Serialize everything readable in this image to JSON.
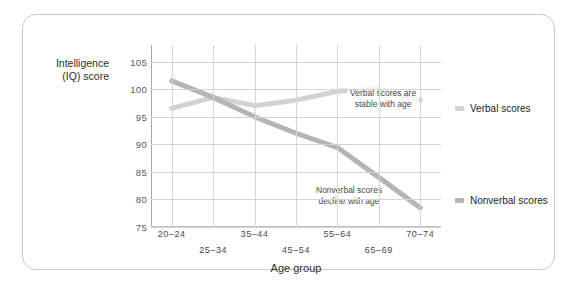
{
  "chart_data": {
    "type": "line",
    "title": "",
    "xlabel": "Age group",
    "ylabel": "Intelligence (IQ) score",
    "ylabel_lines": [
      "Intelligence",
      "(IQ) score"
    ],
    "categories": [
      "20–24",
      "25–34",
      "35–44",
      "45–54",
      "55–64",
      "65–69",
      "70–74"
    ],
    "yticks": [
      75,
      80,
      85,
      90,
      95,
      100,
      105
    ],
    "ylim": [
      75,
      108
    ],
    "grid": true,
    "legend_position": "right",
    "series": [
      {
        "name": "Verbal scores",
        "color": "#d2d2d2",
        "values": [
          96.5,
          98.5,
          97.0,
          98.0,
          99.6,
          100.0,
          98.0
        ]
      },
      {
        "name": "Nonverbal scores",
        "color": "#b5b5b5",
        "values": [
          101.5,
          98.5,
          95.0,
          92.0,
          89.4,
          84.0,
          78.5
        ]
      }
    ],
    "annotations": [
      {
        "id": "verbal-note",
        "text_lines": [
          "Verbal scores are",
          "stable with age"
        ]
      },
      {
        "id": "nonverbal-note",
        "text_lines": [
          "Nonverbal scores",
          "decline with age"
        ]
      }
    ]
  },
  "colors": {
    "verbal": "#d2d2d2",
    "nonverbal": "#b5b5b5",
    "grid": "#d5d5d5",
    "axis": "#a8a8a8",
    "border": "#c9c9c9",
    "text": "#2d2d2d"
  }
}
